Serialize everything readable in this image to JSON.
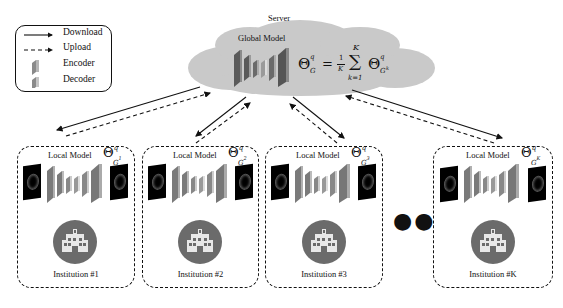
{
  "legend": {
    "items": [
      {
        "icon": "solid-arrow",
        "label": "Download"
      },
      {
        "icon": "dashed-arrow",
        "label": "Upload"
      },
      {
        "icon": "encoder-block",
        "label": "Encoder"
      },
      {
        "icon": "decoder-block",
        "label": "Decoder"
      }
    ]
  },
  "server": {
    "label": "Server",
    "model_label": "Global Model",
    "equation": {
      "lhs": "Θ",
      "lhs_sup": "q",
      "lhs_sub": "G",
      "equals": "=",
      "frac_num": "1",
      "frac_den": "K",
      "sum": "∑",
      "sum_upper": "K",
      "sum_lower": "k=1",
      "rhs": "Θ",
      "rhs_sup": "q",
      "rhs_sub": "G",
      "rhs_sub_sup": "k"
    }
  },
  "institutions": [
    {
      "title": "Local Model",
      "theta": "Θ",
      "sup": "q",
      "sub": "G",
      "sub_sup": "1",
      "label": "Institution #1"
    },
    {
      "title": "Local Model",
      "theta": "Θ",
      "sup": "q",
      "sub": "G",
      "sub_sup": "2",
      "label": "Institution #2"
    },
    {
      "title": "Local Model",
      "theta": "Θ",
      "sup": "q",
      "sub": "G",
      "sub_sup": "3",
      "label": "Institution #3"
    },
    {
      "title": "Local Model",
      "theta": "Θ",
      "sup": "q",
      "sub": "G",
      "sub_sup": "K",
      "label": "Institution #K"
    }
  ],
  "ellipsis": "●●●",
  "colors": {
    "cloud": "#c8c8c8",
    "layer_front": "#8a8a8a",
    "layer_side": "#5a5a5a",
    "hospital_circle": "#6b6b6b",
    "hospital_building": "#e6e6e6"
  }
}
